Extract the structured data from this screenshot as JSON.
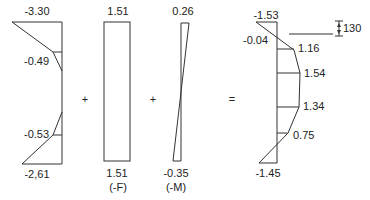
{
  "diagram": {
    "operators": {
      "plus1": "+",
      "plus2": "+",
      "equals": "="
    },
    "left_diagram": {
      "top_label": "-3.30",
      "upper_mid_label": "-0.49",
      "lower_mid_label": "-0.53",
      "bottom_label": "-2,61"
    },
    "axial_diagram": {
      "top_label": "1.51",
      "bottom_label": "1.51",
      "caption": "(-F)"
    },
    "moment_diagram": {
      "top_label": "0.26",
      "bottom_label": "-0.35",
      "caption": "(-M)"
    },
    "result_diagram": {
      "top_label": "-1.53",
      "left_label": "-0.04",
      "values": [
        "1.16",
        "1.54",
        "1.34",
        "0.75"
      ],
      "bottom_label": "-1.45",
      "dimension_label": "130"
    }
  }
}
